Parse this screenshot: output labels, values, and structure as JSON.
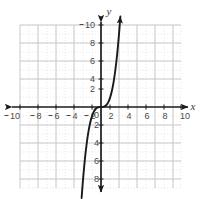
{
  "figure": {
    "width": 207,
    "height": 199,
    "background": "#ffffff"
  },
  "chart_data": {
    "type": "line",
    "title": "",
    "subtitle": "",
    "xlabel": "x",
    "ylabel": "y",
    "function": "y = x^3",
    "xlim": [
      -10,
      10
    ],
    "ylim": [
      -10,
      10
    ],
    "grid": true,
    "grid_major_step": 2,
    "grid_minor_step": 1,
    "legend": false,
    "legend_position": "none",
    "origin_label": "0",
    "x_tick_labels": [
      "10",
      "8",
      "6",
      "4",
      "2",
      "2",
      "4",
      "6",
      "8",
      "10"
    ],
    "x_tick_values": [
      -10,
      -8,
      -6,
      -4,
      -2,
      2,
      4,
      6,
      8,
      10
    ],
    "y_tick_labels": [
      "10",
      "8",
      "6",
      "4",
      "2",
      "2",
      "4",
      "6",
      "8"
    ],
    "y_tick_values": [
      10,
      8,
      6,
      4,
      2,
      -2,
      -4,
      -6,
      -8
    ],
    "series": [
      {
        "name": "y = x^3",
        "color": "#1a1a1a",
        "arrow_start": true,
        "arrow_end": true,
        "x": [
          -2.15,
          -2.0,
          -1.8,
          -1.6,
          -1.4,
          -1.2,
          -1.0,
          -0.8,
          -0.6,
          -0.4,
          -0.2,
          0.0,
          0.2,
          0.4,
          0.6,
          0.8,
          1.0,
          1.2,
          1.4,
          1.6,
          1.8,
          2.0,
          2.15
        ],
        "y": [
          -9.94,
          -8.0,
          -5.83,
          -4.1,
          -2.74,
          -1.73,
          -1.0,
          -0.51,
          -0.22,
          -0.06,
          -0.01,
          0.0,
          0.01,
          0.06,
          0.22,
          0.51,
          1.0,
          1.73,
          2.74,
          4.1,
          5.83,
          8.0,
          9.94
        ]
      }
    ],
    "axis_colors": {
      "axis": "#1a1a1a",
      "grid_major": "#c9c9c9",
      "grid_minor": "#d8d8d8",
      "tick_text": "#4a4a4a"
    }
  }
}
